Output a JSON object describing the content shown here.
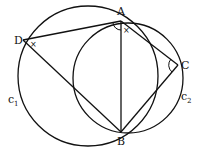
{
  "diagram": {
    "type": "geometry",
    "points": {
      "A": {
        "label": "A",
        "x": 121,
        "y": 21
      },
      "B": {
        "label": "B",
        "x": 121,
        "y": 132
      },
      "C": {
        "label": "C",
        "x": 178,
        "y": 65
      },
      "D": {
        "label": "D",
        "x": 23,
        "y": 40
      }
    },
    "circles": [
      {
        "name": "c1",
        "label": "c",
        "subscript": "1",
        "cx": 88,
        "cy": 76,
        "r": 70
      },
      {
        "name": "c2",
        "label": "c",
        "subscript": "2",
        "cx": 128,
        "cy": 78,
        "r": 55
      }
    ],
    "segments": [
      "DA",
      "DB",
      "AB",
      "AC",
      "CB"
    ],
    "angle_marks": [
      {
        "at": "A",
        "mark": "arc"
      },
      {
        "at": "A",
        "mark": "x"
      },
      {
        "at": "D",
        "mark": "x"
      },
      {
        "at": "C",
        "mark": "arc"
      }
    ],
    "labels": {
      "A": "A",
      "B": "B",
      "C": "C",
      "D": "D",
      "c1_main": "c",
      "c1_sub": "1",
      "c2_main": "c",
      "c2_sub": "2",
      "x_mark": "×"
    }
  }
}
